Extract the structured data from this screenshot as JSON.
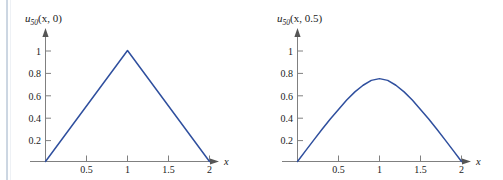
{
  "page": {
    "background_color": "#ffffff",
    "rule_color": "#aab9cc"
  },
  "style": {
    "curve_color": "#2f4f9e",
    "axis_color": "#808080",
    "text_color": "#1a1a1a"
  },
  "figures": [
    {
      "id": "left",
      "y_axis_label_main": "u",
      "y_axis_label_sub": "50",
      "y_axis_label_args": "(x, 0)",
      "y_axis_label_full": "u50(x, 0)",
      "x_axis_name": "x"
    },
    {
      "id": "right",
      "y_axis_label_main": "u",
      "y_axis_label_sub": "50",
      "y_axis_label_args": "(x, 0.5)",
      "y_axis_label_full": "u50(x, 0.5)",
      "x_axis_name": "x"
    }
  ],
  "chart_data": [
    {
      "type": "line",
      "id": "left",
      "title": "u50(x, 0)",
      "xlabel": "x",
      "ylabel": "u50(x, 0)",
      "xlim": [
        0,
        2.15
      ],
      "ylim": [
        0,
        1.12
      ],
      "xticks": [
        0.5,
        1,
        1.5,
        2
      ],
      "xtick_labels": [
        "0.5",
        "1",
        "1.5",
        "2"
      ],
      "yticks": [
        0.2,
        0.4,
        0.6,
        0.8,
        1
      ],
      "ytick_labels": [
        "0.2",
        "0.4",
        "0.6",
        "0.8",
        "1"
      ],
      "grid": false,
      "legend": false,
      "series": [
        {
          "name": "u50(x, 0)",
          "color": "#2f4f9e",
          "x": [
            0,
            0.1,
            0.2,
            0.3,
            0.4,
            0.5,
            0.6,
            0.7,
            0.8,
            0.9,
            1.0,
            1.1,
            1.2,
            1.3,
            1.4,
            1.5,
            1.6,
            1.7,
            1.8,
            1.9,
            2.0
          ],
          "y": [
            0,
            0.1,
            0.2,
            0.3,
            0.4,
            0.5,
            0.6,
            0.7,
            0.8,
            0.9,
            1.0,
            0.9,
            0.8,
            0.7,
            0.6,
            0.5,
            0.4,
            0.3,
            0.2,
            0.1,
            0
          ]
        }
      ]
    },
    {
      "type": "line",
      "id": "right",
      "title": "u50(x, 0.5)",
      "xlabel": "x",
      "ylabel": "u50(x, 0.5)",
      "xlim": [
        0,
        2.15
      ],
      "ylim": [
        0,
        1.12
      ],
      "xticks": [
        0.5,
        1,
        1.5,
        2
      ],
      "xtick_labels": [
        "0.5",
        "1",
        "1.5",
        "2"
      ],
      "yticks": [
        0.2,
        0.4,
        0.6,
        0.8,
        1
      ],
      "ytick_labels": [
        "0.2",
        "0.4",
        "0.6",
        "0.8",
        "1"
      ],
      "grid": false,
      "legend": false,
      "series": [
        {
          "name": "u50(x, 0.5)",
          "color": "#2f4f9e",
          "x": [
            0,
            0.1,
            0.2,
            0.3,
            0.4,
            0.5,
            0.6,
            0.7,
            0.8,
            0.9,
            1.0,
            1.1,
            1.2,
            1.3,
            1.4,
            1.5,
            1.6,
            1.7,
            1.8,
            1.9,
            2.0
          ],
          "y": [
            0,
            0.098,
            0.196,
            0.292,
            0.385,
            0.47,
            0.556,
            0.63,
            0.69,
            0.734,
            0.75,
            0.734,
            0.69,
            0.63,
            0.556,
            0.47,
            0.385,
            0.292,
            0.196,
            0.098,
            0
          ]
        }
      ]
    }
  ]
}
